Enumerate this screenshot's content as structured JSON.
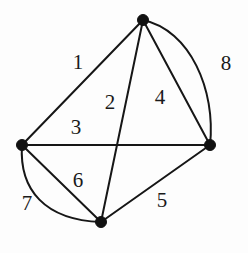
{
  "figure": {
    "kind": "undirected-multigraph-diagram",
    "width": 248,
    "height": 253,
    "background_color": "#fdfdfd",
    "stroke_color": "#161616",
    "vertex_color": "#111111",
    "label_color": "#1a1a1a"
  },
  "vertices": [
    {
      "id": "top",
      "name": "vertex-top",
      "x": 143,
      "y": 20,
      "r": 5.5
    },
    {
      "id": "left",
      "name": "vertex-left",
      "x": 22,
      "y": 145,
      "r": 5.5
    },
    {
      "id": "right",
      "name": "vertex-right",
      "x": 210,
      "y": 145,
      "r": 5.5
    },
    {
      "id": "bottom",
      "name": "vertex-bottom",
      "x": 101,
      "y": 222,
      "r": 5.5
    }
  ],
  "edges": [
    {
      "label": "1",
      "name": "edge-1",
      "from": "top",
      "to": "left",
      "shape": "straight",
      "path": "M 143 20 L 22 145",
      "label_x": 78,
      "label_y": 62
    },
    {
      "label": "2",
      "name": "edge-2",
      "from": "top",
      "to": "bottom",
      "shape": "straight",
      "path": "M 143 20 L 101 222",
      "label_x": 110,
      "label_y": 102
    },
    {
      "label": "3",
      "name": "edge-3",
      "from": "left",
      "to": "right",
      "shape": "straight",
      "path": "M 22 145 L 210 145",
      "label_x": 76,
      "label_y": 127
    },
    {
      "label": "4",
      "name": "edge-4",
      "from": "top",
      "to": "right",
      "shape": "straight",
      "path": "M 143 20 L 210 145",
      "label_x": 160,
      "label_y": 97
    },
    {
      "label": "5",
      "name": "edge-5",
      "from": "bottom",
      "to": "right",
      "shape": "straight",
      "path": "M 101 222 L 210 145",
      "label_x": 162,
      "label_y": 200
    },
    {
      "label": "6",
      "name": "edge-6",
      "from": "left",
      "to": "bottom",
      "shape": "straight",
      "path": "M 22 145 L 101 222",
      "label_x": 78,
      "label_y": 180
    },
    {
      "label": "7",
      "name": "edge-7",
      "from": "left",
      "to": "bottom",
      "shape": "curved",
      "path": "M 22 145 C 19 190 45 220 101 222",
      "label_x": 27,
      "label_y": 203
    },
    {
      "label": "8",
      "name": "edge-8",
      "from": "top",
      "to": "right",
      "shape": "curved",
      "path": "M 143 20 C 190 30 216 90 210 145",
      "label_x": 226,
      "label_y": 63
    }
  ]
}
